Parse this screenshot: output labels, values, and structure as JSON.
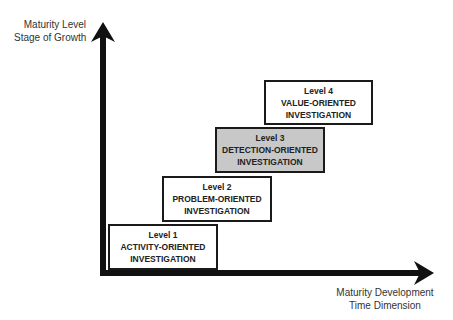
{
  "axes": {
    "y_axis": {
      "line1": "Maturity Level",
      "line2": "Stage of Growth"
    },
    "x_axis": {
      "line1": "Maturity Development",
      "line2": "Time Dimension"
    }
  },
  "levels": [
    {
      "level": "Level 1",
      "name": "ACTIVITY-ORIENTED",
      "sub": "INVESTIGATION",
      "highlighted": false
    },
    {
      "level": "Level 2",
      "name": "PROBLEM-ORIENTED",
      "sub": "INVESTIGATION",
      "highlighted": false
    },
    {
      "level": "Level 3",
      "name": "DETECTION-ORIENTED",
      "sub": "INVESTIGATION",
      "highlighted": true
    },
    {
      "level": "Level 4",
      "name": "VALUE-ORIENTED",
      "sub": "INVESTIGATION",
      "highlighted": false
    }
  ],
  "colors": {
    "axis": "#111111",
    "box_border": "#1a1a1a",
    "highlight_fill": "#c8c8c8"
  }
}
